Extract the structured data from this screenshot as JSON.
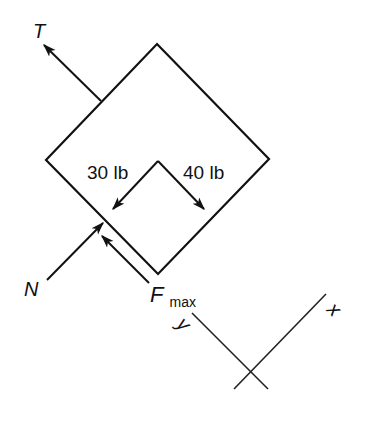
{
  "diagram": {
    "type": "free-body-diagram",
    "body": "square block on incline (rotated 45°)",
    "colors": {
      "stroke": "#111111",
      "background": "#ffffff"
    },
    "forces": [
      {
        "id": "tension",
        "label": "T",
        "direction": "up-left"
      },
      {
        "id": "weight-component-30",
        "label": "30 lb",
        "direction": "down-left"
      },
      {
        "id": "weight-component-40",
        "label": "40 lb",
        "direction": "down-right"
      },
      {
        "id": "normal",
        "label": "N",
        "direction": "up-right"
      },
      {
        "id": "friction",
        "label": "F",
        "subscript": "max",
        "direction": "up-left"
      }
    ],
    "axes": {
      "x_label": "x",
      "y_label": "y"
    }
  }
}
